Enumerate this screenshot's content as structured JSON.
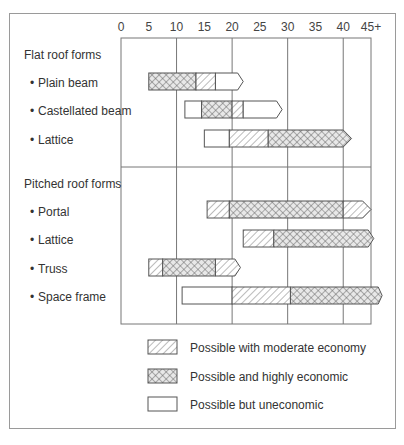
{
  "chart_data": {
    "type": "range-bar",
    "title": "",
    "xlabel": "",
    "ylabel": "",
    "x_ticks": [
      "0",
      "5",
      "10",
      "15",
      "20",
      "25",
      "30",
      "35",
      "40",
      "45+"
    ],
    "xlim": [
      0,
      45
    ],
    "grid_x": [
      10,
      20,
      30,
      40
    ],
    "sections": [
      {
        "name": "Flat roof forms",
        "rows": [
          {
            "label": "Plain beam",
            "segments": [
              {
                "from": 5,
                "to": 13.5,
                "type": "highly"
              },
              {
                "from": 13.5,
                "to": 17,
                "type": "moderate"
              },
              {
                "from": 17,
                "to": 21,
                "type": "uneconomic"
              }
            ],
            "arrow_end": 22
          },
          {
            "label": "Castellated beam",
            "segments": [
              {
                "from": 11.5,
                "to": 14.5,
                "type": "uneconomic"
              },
              {
                "from": 14.5,
                "to": 20,
                "type": "highly"
              },
              {
                "from": 20,
                "to": 22,
                "type": "moderate"
              },
              {
                "from": 22,
                "to": 28,
                "type": "uneconomic"
              }
            ],
            "arrow_end": 29
          },
          {
            "label": "Lattice",
            "segments": [
              {
                "from": 15,
                "to": 19.5,
                "type": "uneconomic"
              },
              {
                "from": 19.5,
                "to": 26.5,
                "type": "moderate"
              },
              {
                "from": 26.5,
                "to": 40,
                "type": "highly"
              }
            ],
            "arrow_end": 41.5
          }
        ]
      },
      {
        "name": "Pitched roof forms",
        "rows": [
          {
            "label": "Portal",
            "segments": [
              {
                "from": 15.5,
                "to": 19.5,
                "type": "moderate"
              },
              {
                "from": 19.5,
                "to": 40,
                "type": "highly"
              },
              {
                "from": 40,
                "to": 43.5,
                "type": "moderate"
              }
            ],
            "arrow_end": 45
          },
          {
            "label": "Lattice",
            "segments": [
              {
                "from": 22,
                "to": 27.5,
                "type": "moderate"
              },
              {
                "from": 27.5,
                "to": 44.5,
                "type": "highly"
              }
            ],
            "arrow_end": 45.5
          },
          {
            "label": "Truss",
            "segments": [
              {
                "from": 5,
                "to": 7.5,
                "type": "moderate"
              },
              {
                "from": 7.5,
                "to": 17,
                "type": "highly"
              },
              {
                "from": 17,
                "to": 20.5,
                "type": "moderate"
              }
            ],
            "arrow_end": 21.5
          },
          {
            "label": "Space frame",
            "segments": [
              {
                "from": 11,
                "to": 20,
                "type": "uneconomic"
              },
              {
                "from": 20,
                "to": 30.5,
                "type": "moderate"
              },
              {
                "from": 30.5,
                "to": 46.3,
                "type": "highly"
              }
            ],
            "arrow_end": 47
          }
        ]
      }
    ],
    "legend": [
      {
        "type": "moderate",
        "label": "Possible with moderate economy"
      },
      {
        "type": "highly",
        "label": "Possible and highly economic"
      },
      {
        "type": "uneconomic",
        "label": "Possible but uneconomic"
      }
    ],
    "legend_position": "bottom"
  },
  "labels": {
    "bullet": "•"
  },
  "colors": {
    "stroke": "#555555",
    "grid": "#777777",
    "frame": "#9a9a9a"
  }
}
